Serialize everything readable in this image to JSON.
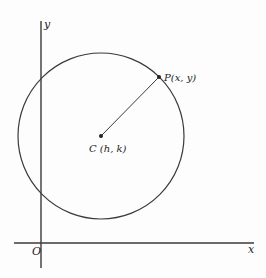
{
  "diagram": {
    "colors": {
      "stroke": "#3a3a3a",
      "text": "#222222",
      "background": "#fdfdfd"
    },
    "axes": {
      "x_label": "x",
      "y_label": "y",
      "origin_label": "O"
    },
    "circle": {
      "center_px": [
        101,
        136
      ],
      "radius_px": 83
    },
    "points": {
      "center": {
        "label": "C (h, k)",
        "px": [
          101,
          136
        ]
      },
      "p": {
        "label": "P(x, y)",
        "px": [
          159,
          77
        ]
      }
    },
    "segments": [
      {
        "from": "center",
        "to": "p",
        "description": "radius from C to P"
      }
    ]
  }
}
